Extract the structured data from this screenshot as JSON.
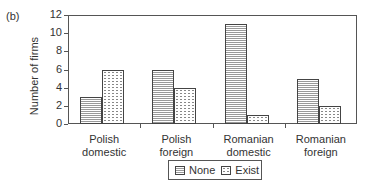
{
  "panel_label": "(b)",
  "chart_data": {
    "type": "bar",
    "title": "",
    "xlabel": "",
    "ylabel": "Number of firms",
    "ylim": [
      0,
      12
    ],
    "yticks": [
      0,
      2,
      4,
      6,
      8,
      10,
      12
    ],
    "grid": false,
    "legend_position": "bottom",
    "categories": [
      "Polish domestic",
      "Polish foreign",
      "Romanian domestic",
      "Romanian foreign"
    ],
    "series": [
      {
        "name": "None",
        "values": [
          3,
          6,
          11,
          5
        ]
      },
      {
        "name": "Exist",
        "values": [
          6,
          4,
          1,
          2
        ]
      }
    ]
  },
  "categories_lines": [
    [
      "Polish",
      "domestic"
    ],
    [
      "Polish",
      "foreign"
    ],
    [
      "Romanian",
      "domestic"
    ],
    [
      "Romanian",
      "foreign"
    ]
  ],
  "legend": {
    "none": "None",
    "exist": "Exist"
  }
}
